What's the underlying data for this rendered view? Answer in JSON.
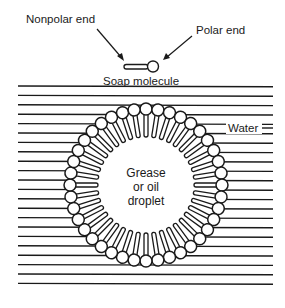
{
  "diagram": {
    "labels": {
      "nonpolar_end": "Nonpolar end",
      "polar_end": "Polar end",
      "soap_molecule": "Soap molecule",
      "water": "Water",
      "droplet_line1": "Grease",
      "droplet_line2": "or oil",
      "droplet_line3": "droplet"
    },
    "water_lines": {
      "x_start": 18,
      "x_end": 273,
      "y_start": 86,
      "spacing": 9.4,
      "count": 22
    },
    "micelle": {
      "center_x": 146,
      "center_y": 185,
      "head_ring_radius": 76,
      "head_radius": 6,
      "tail_inner_radius": 48,
      "tail_width": 4,
      "molecule_count": 40
    },
    "colors": {
      "stroke": "#1a1a1a",
      "background": "#ffffff"
    }
  }
}
